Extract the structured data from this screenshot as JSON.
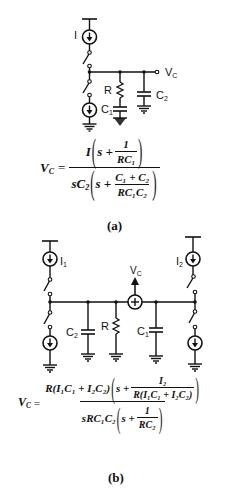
{
  "part_a": {
    "labels": {
      "current_source": "I",
      "output": "V",
      "output_sub": "C",
      "resistor": "R",
      "cap1": "C",
      "cap1_sub": "1",
      "cap2": "C",
      "cap2_sub": "2"
    },
    "equation": {
      "lhs": "V",
      "lhs_sub": "C",
      "equals": "=",
      "num_prefix": "I",
      "num_s": "s +",
      "num_frac_num": "1",
      "num_frac_den": "RC",
      "num_frac_den_sub": "1",
      "den_prefix": "sC",
      "den_prefix_sub": "2",
      "den_s": "s +",
      "den_frac_num": "C₁ + C₂",
      "den_frac_den": "RC₁C₂"
    },
    "caption": "(a)"
  },
  "part_b": {
    "labels": {
      "source1": "I",
      "source1_sub": "1",
      "source2": "I",
      "source2_sub": "2",
      "output": "V",
      "output_sub": "C",
      "cap2": "C",
      "cap2_sub": "2",
      "resistor": "R",
      "cap1": "C",
      "cap1_sub": "1"
    },
    "equation": {
      "lhs": "V",
      "lhs_sub": "C",
      "equals": "=",
      "num_prefix": "R(I₁C₁ + I₂C₂)",
      "num_s": "s +",
      "num_frac_num": "I₂",
      "num_frac_den": "R(I₁C₁ + I₂C₂)",
      "den_prefix": "sRC₁C₂",
      "den_s": "s +",
      "den_frac_num": "1",
      "den_frac_den": "RC₂"
    },
    "caption": "(b)"
  }
}
